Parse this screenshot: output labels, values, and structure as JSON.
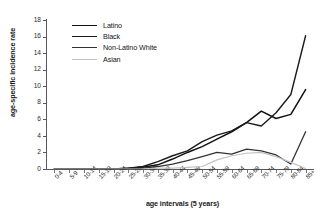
{
  "chart_data": {
    "type": "line",
    "title": "",
    "xlabel": "age intervals (5 years)",
    "ylabel": "age-specific incidence rate",
    "categories": [
      "0-4",
      "5-9",
      "10-14",
      "15-19",
      "20-24",
      "25-29",
      "30-34",
      "35-39",
      "40-44",
      "45-49",
      "50-54",
      "55-59",
      "60-64",
      "65-69",
      "70-74",
      "75-79",
      "80-84",
      "85+"
    ],
    "ylim": [
      0,
      18
    ],
    "yticks": [
      0,
      2,
      4,
      6,
      8,
      10,
      12,
      14,
      16,
      18
    ],
    "grid": false,
    "legend_position": "top-left",
    "series": [
      {
        "name": "Latino",
        "color": "#111111",
        "values": [
          0,
          0,
          0,
          0,
          0,
          0.1,
          0.2,
          0.5,
          1.2,
          2.0,
          2.7,
          3.6,
          4.5,
          5.6,
          7.0,
          6.1,
          6.6,
          9.6
        ]
      },
      {
        "name": "Black",
        "color": "#1a1a1a",
        "values": [
          0,
          0,
          0,
          0,
          0,
          0.1,
          0.3,
          0.9,
          1.6,
          2.2,
          3.3,
          4.1,
          4.6,
          5.6,
          5.2,
          6.8,
          9.0,
          16.1
        ]
      },
      {
        "name": "Non-Latino White",
        "color": "#333333",
        "values": [
          0,
          0,
          0,
          0,
          0,
          0,
          0.1,
          0.3,
          0.6,
          1.0,
          1.5,
          2.0,
          1.8,
          2.4,
          2.2,
          1.7,
          0.6,
          4.5
        ]
      },
      {
        "name": "Asian",
        "color": "#c2c2c2",
        "values": [
          0,
          0,
          0,
          0,
          0,
          0,
          0,
          0.1,
          0.1,
          0.2,
          0.3,
          1.1,
          1.6,
          1.9,
          2.0,
          1.5,
          0.8,
          0.05
        ]
      }
    ]
  },
  "legend": {
    "items": [
      {
        "label": "Latino",
        "color": "#111111",
        "width": 1.8
      },
      {
        "label": "Black",
        "color": "#1a1a1a",
        "width": 1.6
      },
      {
        "label": "Non-Latino White",
        "color": "#333333",
        "width": 1.6
      },
      {
        "label": "Asian",
        "color": "#c2c2c2",
        "width": 1.4
      }
    ]
  }
}
